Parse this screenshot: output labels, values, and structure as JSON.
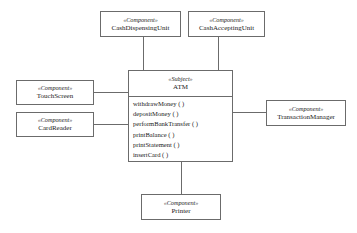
{
  "diagram": {
    "type": "uml-component-diagram",
    "line_color": "#6b6b6b",
    "background_color": "#ffffff",
    "text_color": "#1a1a1a"
  },
  "subject": {
    "stereotype": "«Subject»",
    "name": "ATM",
    "operations": [
      "withdrawMoney ( )",
      "depositMoney ( )",
      "performBankTransfer ( )",
      "printBalance ( )",
      "printStatement ( )",
      "insertCard ( )"
    ]
  },
  "components": {
    "cash_dispensing_unit": {
      "stereotype": "«Component»",
      "name": "CashDispensingUnit"
    },
    "cash_accepting_unit": {
      "stereotype": "«Component»",
      "name": "CashAcceptingUnit"
    },
    "touch_screen": {
      "stereotype": "«Component»",
      "name": "TouchScreen"
    },
    "card_reader": {
      "stereotype": "«Component»",
      "name": "CardReader"
    },
    "transaction_manager": {
      "stereotype": "«Component»",
      "name": "TransactionManager"
    },
    "printer": {
      "stereotype": "«Component»",
      "name": "Printer"
    }
  }
}
